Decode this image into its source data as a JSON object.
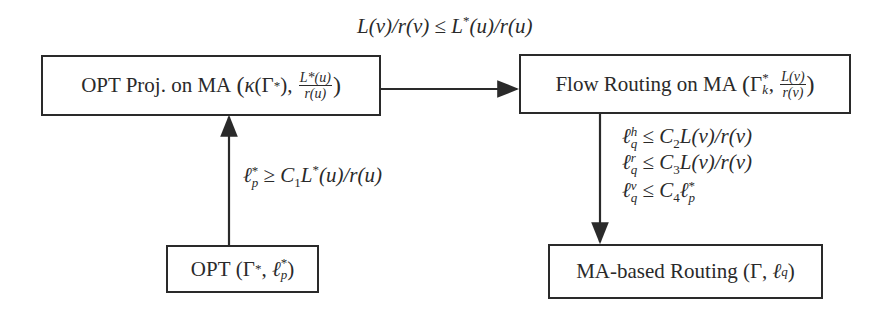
{
  "diagram": {
    "type": "flow",
    "nodes": [
      {
        "id": "opt_proj",
        "text": "OPT Proj. on MA",
        "math": "(κ(Γ*), L*(u)/r(u))"
      },
      {
        "id": "flow_routing",
        "text": "Flow Routing on MA",
        "math": "(Γ*_k, L(v)/r(v))"
      },
      {
        "id": "opt",
        "text": "OPT",
        "math": "(Γ*, ℓ*_p)"
      },
      {
        "id": "ma_routing",
        "text": "MA-based Routing",
        "math": "(Γ, ℓ_q)"
      }
    ],
    "edges": [
      {
        "from": "opt",
        "to": "opt_proj",
        "label": "ℓ*_p ≥ C1 L*(u)/r(u)"
      },
      {
        "from": "opt_proj",
        "to": "flow_routing",
        "label": "L(v)/r(v) ≤ L*(u)/r(u)"
      },
      {
        "from": "flow_routing",
        "to": "ma_routing",
        "labels": [
          "ℓ^h_q ≤ C2 L(v)/r(v)",
          "ℓ^r_q ≤ C3 L(v)/r(v)",
          "ℓ^v_q ≤ C4 ℓ*_p"
        ]
      }
    ]
  },
  "boxes": {
    "opt_proj": {
      "title": "OPT Proj. on MA",
      "kappa": "κ",
      "gamma": "Γ",
      "star": "*",
      "num": "L*(u)",
      "den": "r(u)"
    },
    "flow_routing": {
      "title": "Flow Routing on MA",
      "gamma": "Γ",
      "star": "*",
      "sub": "k",
      "num": "L(v)",
      "den": "r(v)"
    },
    "opt": {
      "title": "OPT",
      "gamma": "Γ",
      "star": "*",
      "ell": "ℓ",
      "sub": "p"
    },
    "ma_routing": {
      "title": "MA-based Routing",
      "gamma": "Γ",
      "ell": "ℓ",
      "sub": "q"
    }
  },
  "labels": {
    "top": {
      "lhs": "L(v)/r(v)",
      "op": " ≤ ",
      "rhs_L": "L",
      "rhs_star": "*",
      "rhs_rest": "(u)/r(u)"
    },
    "left": {
      "ell": "ℓ",
      "sup": "*",
      "sub": "p",
      "op": " ≥ ",
      "C": "C",
      "Csub": "1",
      "L": "L",
      "Lstar": "*",
      "rest": "(u)/r(u)"
    },
    "right": [
      {
        "ell": "ℓ",
        "sup": "h",
        "sub": "q",
        "op": " ≤ ",
        "C": "C",
        "Csub": "2",
        "rest": "L(v)/r(v)"
      },
      {
        "ell": "ℓ",
        "sup": "r",
        "sub": "q",
        "op": " ≤ ",
        "C": "C",
        "Csub": "3",
        "rest": "L(v)/r(v)"
      },
      {
        "ell": "ℓ",
        "sup": "v",
        "sub": "q",
        "op": " ≤ ",
        "C": "C",
        "Csub": "4",
        "rest_ell": "ℓ",
        "rest_sup": "*",
        "rest_sub": "p"
      }
    ]
  },
  "colors": {
    "stroke": "#2a2a2a",
    "background": "#ffffff"
  }
}
